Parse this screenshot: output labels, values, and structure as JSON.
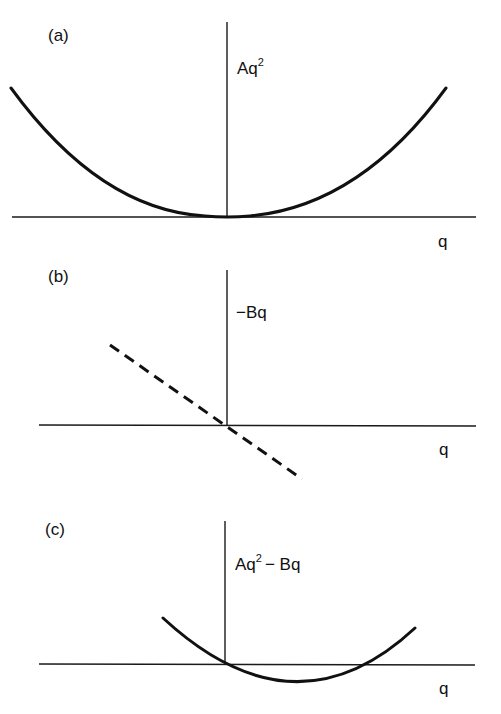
{
  "panels": [
    {
      "id": "a",
      "tag": "(a)",
      "ylabel": "Aq",
      "ylabel_sup": "2",
      "ylabel_rest": "",
      "xlabel": "q",
      "curve": "parabola Aq^2 (solid)"
    },
    {
      "id": "b",
      "tag": "(b)",
      "ylabel": "−Bq",
      "ylabel_sup": "",
      "ylabel_rest": "",
      "xlabel": "q",
      "curve": "line -Bq (dashed)"
    },
    {
      "id": "c",
      "tag": "(c)",
      "ylabel": "Aq",
      "ylabel_sup": "2",
      "ylabel_rest": "− Bq",
      "xlabel": "q",
      "curve": "parabola Aq^2 - Bq (solid)"
    }
  ],
  "colors": {
    "ink": "#111111",
    "background": "#ffffff"
  }
}
